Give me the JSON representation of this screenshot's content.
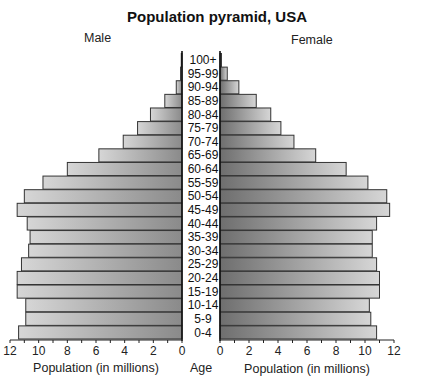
{
  "chart_data": {
    "type": "bar",
    "orientation": "horizontal-pyramid",
    "title": "Population pyramid, USA",
    "left_label": "Male",
    "right_label": "Female",
    "center_axis_label": "Age",
    "xlabel_left": "Population (in millions)",
    "xlabel_right": "Population (in millions)",
    "xlim": [
      0,
      12
    ],
    "x_ticks": [
      0,
      2,
      4,
      6,
      8,
      10,
      12
    ],
    "minor_tick_step": 1,
    "grid": false,
    "categories": [
      "100+",
      "95-99",
      "90-94",
      "85-89",
      "80-84",
      "75-79",
      "70-74",
      "65-69",
      "60-64",
      "55-59",
      "50-54",
      "45-49",
      "40-44",
      "35-39",
      "30-34",
      "25-29",
      "20-24",
      "15-19",
      "10-14",
      "5-9",
      "0-4"
    ],
    "series": [
      {
        "name": "Male",
        "values": [
          0.05,
          0.1,
          0.4,
          1.2,
          2.2,
          3.1,
          4.1,
          5.8,
          8.0,
          9.7,
          11.0,
          11.5,
          10.8,
          10.6,
          10.7,
          11.2,
          11.5,
          11.5,
          10.9,
          10.9,
          11.4
        ]
      },
      {
        "name": "Female",
        "values": [
          0.1,
          0.5,
          1.3,
          2.5,
          3.5,
          4.2,
          5.1,
          6.6,
          8.7,
          10.2,
          11.5,
          11.7,
          10.8,
          10.5,
          10.5,
          10.8,
          11.0,
          11.0,
          10.3,
          10.4,
          10.8
        ]
      }
    ],
    "colors": {
      "bar_light": "#d4d4d4",
      "bar_dark": "#7a7a7a",
      "outline": "#333333",
      "axis": "#222222"
    }
  }
}
